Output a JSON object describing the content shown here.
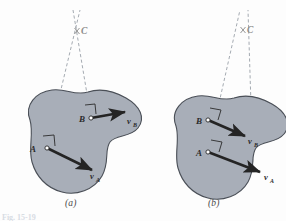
{
  "figure": {
    "number_label": "Fig. 15-19",
    "colors": {
      "body_fill": "#a8aeb8",
      "body_stroke": "#4a4f57",
      "vector": "#242424",
      "dashed_line": "#9aa0a8",
      "background": "#fdfdfd",
      "label_text": "#2b2b2b",
      "c_label_text": "#8b8b8b"
    },
    "panels": [
      {
        "id": "a",
        "caption": "(a)",
        "center_label": "C",
        "points": [
          {
            "name": "A",
            "label": "A"
          },
          {
            "name": "B",
            "label": "B"
          }
        ],
        "vectors": [
          {
            "name": "vA",
            "symbol": "v",
            "subscript": "A"
          },
          {
            "name": "vB",
            "symbol": "v",
            "subscript": "B"
          }
        ]
      },
      {
        "id": "b",
        "caption": "(b)",
        "center_label": "C",
        "points": [
          {
            "name": "A",
            "label": "A"
          },
          {
            "name": "B",
            "label": "B"
          }
        ],
        "vectors": [
          {
            "name": "vA",
            "symbol": "v",
            "subscript": "A"
          },
          {
            "name": "vB",
            "symbol": "v",
            "subscript": "B"
          }
        ]
      }
    ]
  }
}
